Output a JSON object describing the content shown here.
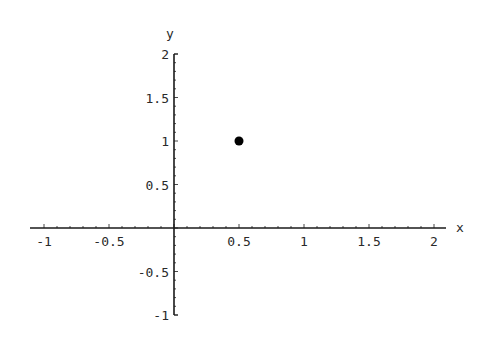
{
  "chart_data": {
    "type": "scatter",
    "title": "",
    "xlabel": "x",
    "ylabel": "y",
    "xlim": [
      -1,
      2
    ],
    "ylim": [
      -1,
      2
    ],
    "x_ticks": [
      -1,
      -0.5,
      0.5,
      1,
      1.5,
      2
    ],
    "x_tick_labels": [
      "-1",
      "-0.5",
      "0.5",
      "1",
      "1.5",
      "2"
    ],
    "y_ticks": [
      -1,
      -0.5,
      0.5,
      1,
      1.5,
      2
    ],
    "y_tick_labels": [
      "-1",
      "-0.5",
      "0.5",
      "1",
      "1.5",
      "2"
    ],
    "grid": false,
    "legend": null,
    "series": [
      {
        "name": "point",
        "points": [
          {
            "x": 0.5,
            "y": 1
          }
        ],
        "color": "#000000"
      }
    ]
  },
  "style": {
    "axis_color": "#1a1a1a",
    "point_color": "#000000",
    "background": "#ffffff"
  }
}
